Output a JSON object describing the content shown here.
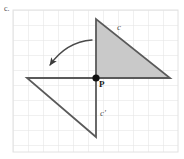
{
  "figure": {
    "problem_label": "c.",
    "width": 184,
    "height": 159,
    "background_color": "#ffffff",
    "grid": {
      "visible": true,
      "cell_size": 15,
      "color": "#e2e2e2",
      "x_start": 13,
      "y_start": 10,
      "x_end": 178,
      "y_end": 152,
      "columns": 11,
      "rows": 10
    },
    "center_point": {
      "name": "P",
      "label": "P",
      "x": 96,
      "y": 78,
      "dot_radius": 3.6,
      "dot_color": "#111111"
    },
    "shapes": [
      {
        "name": "triangle-c",
        "label": "c",
        "role": "pre-image",
        "fill": "#c9c9c9",
        "stroke": "#5a5a5a",
        "stroke_width": 1.8,
        "points": [
          [
            96,
            19
          ],
          [
            96,
            78
          ],
          [
            170,
            78
          ]
        ],
        "label_x": 117,
        "label_y": 23
      },
      {
        "name": "triangle-c-prime",
        "label": "c'",
        "role": "image",
        "fill": "none",
        "stroke": "#5a5a5a",
        "stroke_width": 1.8,
        "points": [
          [
            96,
            78
          ],
          [
            27,
            78
          ],
          [
            96,
            137
          ]
        ],
        "label_x": 100,
        "label_y": 109
      }
    ],
    "rotation_arrow": {
      "name": "rotation-arrow",
      "color": "#4a4a4a",
      "stroke_width": 1.3,
      "start_x": 92,
      "start_y": 40,
      "end_x": 48,
      "end_y": 67,
      "control_x": 66,
      "control_y": 42,
      "direction": "counterclockwise",
      "arrowhead_at": "end"
    }
  }
}
